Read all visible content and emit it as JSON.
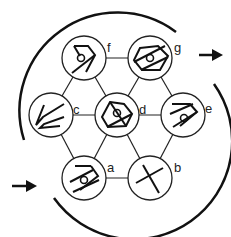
{
  "diagram": {
    "type": "hexagonal-node-graph",
    "stroke_color": "#1a1a1a",
    "nodes": [
      {
        "id": "f",
        "label": "f",
        "x": 84,
        "y": 58
      },
      {
        "id": "g",
        "label": "g",
        "x": 150,
        "y": 58
      },
      {
        "id": "c",
        "label": "c",
        "x": 51,
        "y": 115
      },
      {
        "id": "d",
        "label": "d",
        "x": 117,
        "y": 115
      },
      {
        "id": "e",
        "label": "e",
        "x": 183,
        "y": 115
      },
      {
        "id": "a",
        "label": "a",
        "x": 84,
        "y": 178
      },
      {
        "id": "b",
        "label": "b",
        "x": 150,
        "y": 178
      }
    ],
    "edges": [
      [
        "f",
        "g"
      ],
      [
        "f",
        "c"
      ],
      [
        "f",
        "d"
      ],
      [
        "g",
        "d"
      ],
      [
        "g",
        "e"
      ],
      [
        "c",
        "d"
      ],
      [
        "d",
        "e"
      ],
      [
        "c",
        "a"
      ],
      [
        "d",
        "a"
      ],
      [
        "d",
        "b"
      ],
      [
        "e",
        "b"
      ],
      [
        "a",
        "b"
      ]
    ],
    "arrows": [
      {
        "name": "input-arrow",
        "direction": "right",
        "position": "lower-left"
      },
      {
        "name": "output-arrow",
        "direction": "right",
        "position": "upper-right"
      }
    ]
  }
}
